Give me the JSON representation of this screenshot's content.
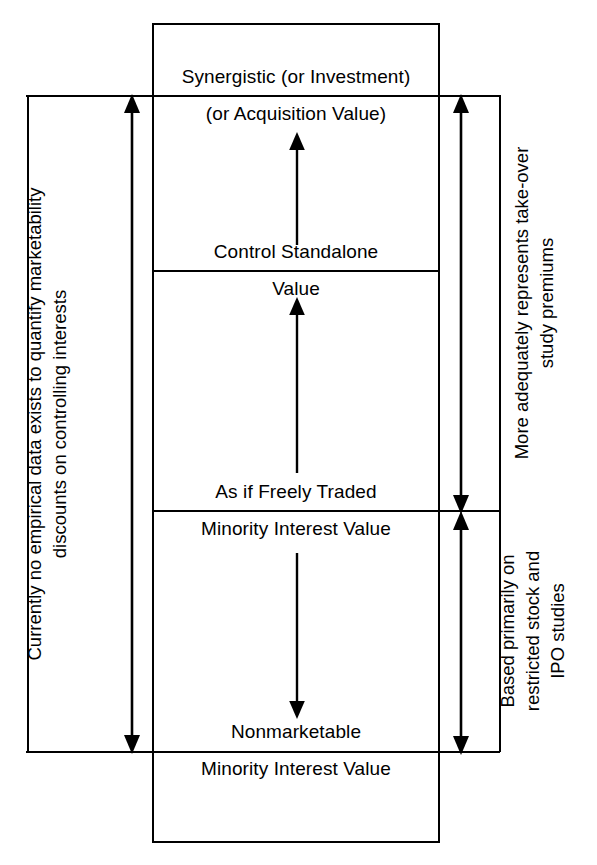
{
  "diagram": {
    "colors": {
      "line": "#000000",
      "background": "#ffffff",
      "text": "#000000"
    },
    "tiers": [
      {
        "id": "synergistic",
        "line1": "Synergistic (or Investment)",
        "line2": "(or Acquisition Value)"
      },
      {
        "id": "control-standalone",
        "line1": "Control Standalone",
        "line2": "Value"
      },
      {
        "id": "freely-traded-minority",
        "line1": "As if Freely Traded",
        "line2": "Minority Interest Value"
      },
      {
        "id": "nonmarketable-minority",
        "line1": "Nonmarketable",
        "line2": "Minority Interest Value"
      }
    ],
    "annotations": {
      "left": "Currently no empirical data exists to quantify marketability\ndiscounts on controlling interests",
      "right_upper": "More adequately represents take-over\nstudy premiums",
      "right_lower": "Based primarily on\nrestricted stock and\nIPO studies"
    },
    "arrows": {
      "left_span": "double-headed-vertical",
      "right_upper_span": "double-headed-vertical",
      "right_lower_span": "double-headed-vertical",
      "inner_control_premium": "up-arrow",
      "inner_minority_discount": "up-arrow",
      "inner_marketability_discount": "down-arrow"
    }
  }
}
